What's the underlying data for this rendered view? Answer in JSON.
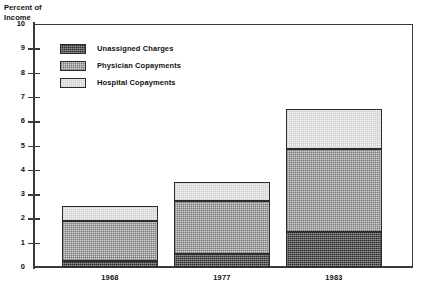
{
  "chart_data": {
    "type": "bar",
    "subtype": "stacked-bar",
    "title": "Percent of Income",
    "xlabel": "",
    "ylabel": "Percent of Income",
    "ylim": [
      0,
      10
    ],
    "ytick_labels": [
      "10",
      "9",
      "8",
      "7",
      "6",
      "5",
      "4",
      "3",
      "2",
      "1",
      "0"
    ],
    "yticks": [
      10,
      9,
      8,
      7,
      6,
      5,
      4,
      3,
      2,
      1,
      0
    ],
    "grid": false,
    "legend_position": "upper-left-inside",
    "categories": [
      "1968",
      "1977",
      "1983"
    ],
    "series": [
      {
        "name": "Unassigned Charges",
        "values": [
          0.25,
          0.55,
          1.45
        ]
      },
      {
        "name": "Physician Copayments",
        "values": [
          1.65,
          2.15,
          3.4
        ]
      },
      {
        "name": "Hospital Copayments",
        "values": [
          0.6,
          0.8,
          1.65
        ]
      }
    ],
    "cumulative_tops": {
      "1968": [
        0.25,
        1.9,
        2.5
      ],
      "1977": [
        0.55,
        2.7,
        3.5
      ],
      "1983": [
        1.45,
        4.85,
        6.5
      ]
    },
    "totals": [
      2.5,
      3.5,
      6.5
    ]
  },
  "axis_title": "Percent of\nIncome",
  "legend": {
    "items": [
      {
        "label": "Unassigned Charges",
        "swatch": "dark-dither-swatch",
        "color": "#2e2e2e"
      },
      {
        "label": "Physician Copayments",
        "swatch": "mid-dither-swatch",
        "color": "#d2d2d2"
      },
      {
        "label": "Hospital Copayments",
        "swatch": "light-dither-swatch",
        "color": "#efefef"
      }
    ]
  },
  "axis": {
    "y_ticks": [
      "10",
      "9",
      "8",
      "7",
      "6",
      "5",
      "4",
      "3",
      "2",
      "1",
      "0"
    ],
    "x_labels": [
      "1968",
      "1977",
      "1983"
    ]
  }
}
